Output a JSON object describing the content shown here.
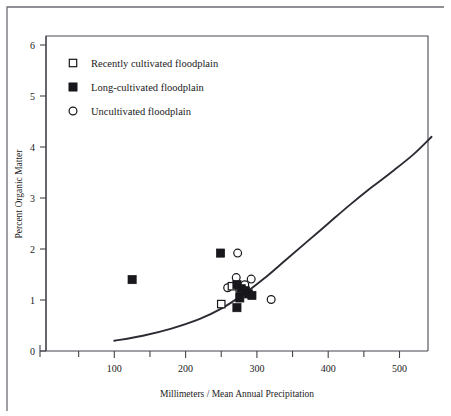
{
  "chart_data": {
    "type": "scatter",
    "title": "",
    "xlabel": "Millimeters / Mean Annual Precipitation",
    "ylabel": "Percent Organic Matter",
    "xlim": [
      0,
      580
    ],
    "ylim": [
      0,
      6.3
    ],
    "grid": false,
    "legend_position": "top-left",
    "x_ticks": [
      100,
      200,
      300,
      400,
      500
    ],
    "x_tick_labels": [
      "100",
      "200",
      "300",
      "400",
      "500"
    ],
    "x_minor_ticks": [
      50,
      150,
      250,
      350,
      450,
      550
    ],
    "y_ticks": [
      0,
      1,
      2,
      3,
      4,
      5,
      6
    ],
    "y_tick_labels": [
      "0",
      "1",
      "2",
      "3",
      "4",
      "5",
      "6"
    ],
    "series": [
      {
        "name": "Recently cultivated floodplain",
        "marker": "open-square",
        "points": [
          {
            "x": 250,
            "y": 0.92
          },
          {
            "x": 265,
            "y": 1.27
          },
          {
            "x": 276,
            "y": 1.2
          }
        ]
      },
      {
        "name": "Long-cultivated floodplain",
        "marker": "filled-square",
        "points": [
          {
            "x": 125,
            "y": 1.4
          },
          {
            "x": 249,
            "y": 1.92
          },
          {
            "x": 272,
            "y": 1.3
          },
          {
            "x": 278,
            "y": 1.22
          },
          {
            "x": 284,
            "y": 1.18
          },
          {
            "x": 288,
            "y": 1.12
          },
          {
            "x": 293,
            "y": 1.09
          },
          {
            "x": 276,
            "y": 1.04
          },
          {
            "x": 272,
            "y": 0.85
          }
        ]
      },
      {
        "name": "Uncultivated floodplain",
        "marker": "open-circle",
        "points": [
          {
            "x": 273,
            "y": 1.92
          },
          {
            "x": 271,
            "y": 1.44
          },
          {
            "x": 283,
            "y": 1.3
          },
          {
            "x": 259,
            "y": 1.24
          },
          {
            "x": 292,
            "y": 1.41
          },
          {
            "x": 277,
            "y": 1.18
          },
          {
            "x": 320,
            "y": 1.01
          }
        ]
      }
    ],
    "trend_curve": {
      "name": "fitted trend",
      "points": [
        {
          "x": 100,
          "y": 0.2
        },
        {
          "x": 140,
          "y": 0.3
        },
        {
          "x": 180,
          "y": 0.44
        },
        {
          "x": 220,
          "y": 0.63
        },
        {
          "x": 250,
          "y": 0.83
        },
        {
          "x": 280,
          "y": 1.1
        },
        {
          "x": 310,
          "y": 1.42
        },
        {
          "x": 340,
          "y": 1.78
        },
        {
          "x": 370,
          "y": 2.14
        },
        {
          "x": 400,
          "y": 2.5
        },
        {
          "x": 430,
          "y": 2.86
        },
        {
          "x": 460,
          "y": 3.2
        },
        {
          "x": 490,
          "y": 3.52
        },
        {
          "x": 520,
          "y": 3.86
        },
        {
          "x": 545,
          "y": 4.2
        }
      ]
    }
  },
  "legend": {
    "items": [
      {
        "marker": "open-square",
        "label": "Recently cultivated floodplain"
      },
      {
        "marker": "filled-square",
        "label": "Long-cultivated floodplain"
      },
      {
        "marker": "open-circle",
        "label": "Uncultivated floodplain"
      }
    ]
  },
  "colors": {
    "marker": "#17171c",
    "curve": "#2b2b33",
    "axis": "#44444c",
    "frame": "#4a4a52",
    "outer_frame": "#6b6b73",
    "background": "#ffffff"
  }
}
